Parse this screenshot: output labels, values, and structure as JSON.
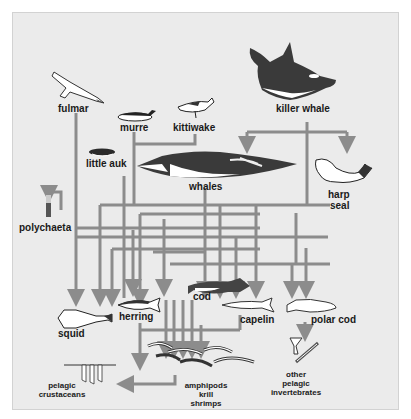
{
  "diagram": {
    "type": "food-web",
    "colors": {
      "background": "#ebebeb",
      "arrow": "#8c8c8c",
      "text": "#1a1a1a",
      "frame": "#ffffff"
    },
    "organisms": {
      "fulmar": "fulmar",
      "murre": "murre",
      "kittiwake": "kittiwake",
      "killer_whale": "killer whale",
      "little_auk": "little auk",
      "whales": "whales",
      "harp_seal_line1": "harp",
      "harp_seal_line2": "seal",
      "polychaeta": "polychaeta",
      "cod": "cod",
      "squid": "squid",
      "herring": "herring",
      "capelin": "capelin",
      "polar_cod": "polar cod",
      "amphipods_line1": "amphipods",
      "amphipods_line2": "krill",
      "amphipods_line3": "shrimps",
      "pelagic_crustaceans_line1": "pelagic",
      "pelagic_crustaceans_line2": "crustaceans",
      "other_invertebrates_line1": "other",
      "other_invertebrates_line2": "pelagic",
      "other_invertebrates_line3": "invertebrates"
    },
    "links": [
      {
        "from": "killer whale",
        "to": "whales"
      },
      {
        "from": "killer whale",
        "to": "harp seal"
      },
      {
        "from": "fulmar",
        "to": "squid"
      },
      {
        "from": "murre",
        "to": "herring"
      },
      {
        "from": "kittiwake",
        "to": "herring"
      },
      {
        "from": "little auk",
        "to": "amphipods/krill/shrimps"
      },
      {
        "from": "whales",
        "to": "cod"
      },
      {
        "from": "whales",
        "to": "capelin"
      },
      {
        "from": "harp seal",
        "to": "polar cod"
      },
      {
        "from": "polychaeta",
        "to": "cod"
      },
      {
        "from": "squid",
        "to": "amphipods/krill/shrimps"
      },
      {
        "from": "herring",
        "to": "amphipods/krill/shrimps"
      },
      {
        "from": "cod",
        "to": "amphipods/krill/shrimps"
      },
      {
        "from": "capelin",
        "to": "amphipods/krill/shrimps"
      },
      {
        "from": "polar cod",
        "to": "other pelagic invertebrates"
      },
      {
        "from": "amphipods/krill/shrimps",
        "to": "pelagic crustaceans"
      }
    ]
  }
}
